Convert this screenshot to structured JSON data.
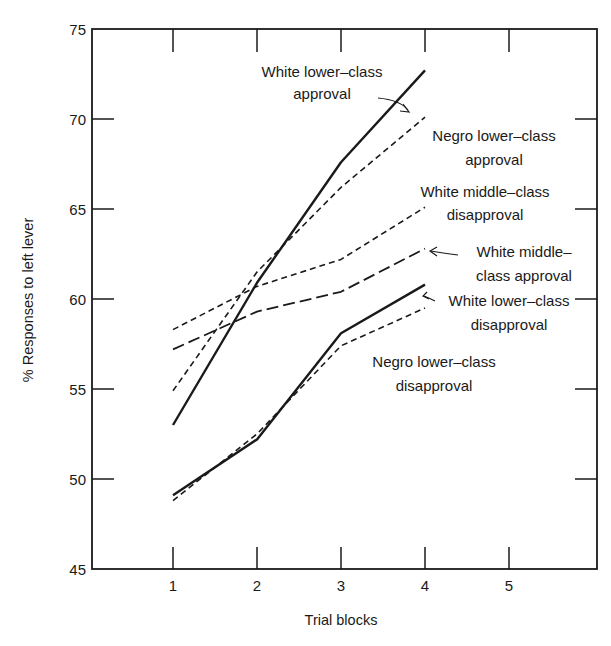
{
  "chart_data": {
    "type": "line",
    "title": "",
    "xlabel": "Trial blocks",
    "ylabel": "% Responses to left lever",
    "xlim": [
      0,
      6.05
    ],
    "ylim": [
      45,
      75
    ],
    "x_ticks": [
      1,
      2,
      3,
      4,
      5
    ],
    "x_tick_labels": [
      "1",
      "2",
      "3",
      "4",
      "5"
    ],
    "y_ticks": [
      45,
      50,
      55,
      60,
      65,
      70,
      75
    ],
    "y_tick_labels": [
      "45",
      "50",
      "55",
      "60",
      "65",
      "70",
      "75"
    ],
    "grid": false,
    "legend": "inline annotations",
    "x": [
      1,
      2,
      3,
      4
    ],
    "series": [
      {
        "name": "White lower-class approval",
        "style": "solid",
        "values": [
          53.0,
          60.9,
          67.6,
          72.7
        ]
      },
      {
        "name": "Negro lower-class approval",
        "style": "short-dash",
        "values": [
          54.9,
          61.5,
          66.2,
          70.1
        ]
      },
      {
        "name": "White middle-class disapproval",
        "style": "short-dash",
        "values": [
          58.3,
          60.7,
          62.2,
          65.1
        ]
      },
      {
        "name": "White middle-class approval",
        "style": "long-dash",
        "values": [
          57.2,
          59.3,
          60.4,
          62.8
        ]
      },
      {
        "name": "White lower-class disapproval",
        "style": "solid",
        "values": [
          49.1,
          52.2,
          58.1,
          60.8
        ]
      },
      {
        "name": "Negro lower-class disapproval",
        "style": "short-dash",
        "values": [
          48.8,
          52.5,
          57.4,
          59.5
        ]
      }
    ],
    "annotations": [
      {
        "series": 0,
        "lines": [
          "White lower–class",
          "approval"
        ]
      },
      {
        "series": 1,
        "lines": [
          "Negro lower–class",
          "approval"
        ]
      },
      {
        "series": 2,
        "lines": [
          "White middle–class",
          "disapproval"
        ]
      },
      {
        "series": 3,
        "lines": [
          "White middle–",
          "class approval"
        ]
      },
      {
        "series": 4,
        "lines": [
          "White lower–class",
          "disapproval"
        ]
      },
      {
        "series": 5,
        "lines": [
          "Negro lower–class",
          "disapproval"
        ]
      }
    ]
  }
}
